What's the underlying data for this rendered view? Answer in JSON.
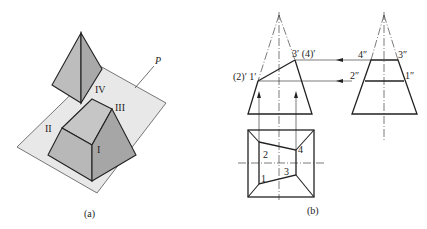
{
  "figure_a": {
    "caption": "(a)",
    "plane_label": "P",
    "part_labels": {
      "I": "I",
      "II": "II",
      "III": "III",
      "IV": "IV"
    },
    "colors": {
      "plane": "#e6e6e6",
      "solid_light": "#c4c4c4",
      "solid_dark": "#a8a8a8",
      "outline": "#222222"
    }
  },
  "figure_b": {
    "caption": "(b)",
    "front_view_labels": {
      "left": "(2)′ 1′",
      "right": "3′ (4)′"
    },
    "side_view_labels": {
      "p4": "4″",
      "p3": "3″",
      "p2": "2″",
      "p1": "1″"
    },
    "top_view_labels": {
      "p1": "1",
      "p2": "2",
      "p3": "3",
      "p4": "4"
    }
  }
}
